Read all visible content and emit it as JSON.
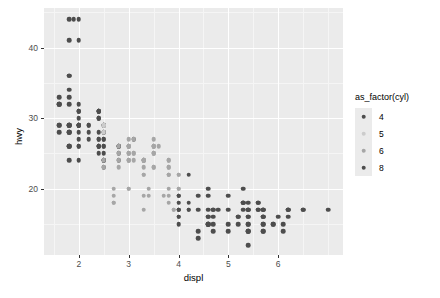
{
  "chart_data": {
    "type": "scatter",
    "title": "",
    "xlabel": "displ",
    "ylabel": "hwy",
    "xlim": [
      1.3,
      7.3
    ],
    "ylim": [
      10.6,
      45.6
    ],
    "xticks": [
      2,
      3,
      4,
      5,
      6
    ],
    "yticks": [
      20,
      30,
      40
    ],
    "xtick_labels": [
      "2",
      "3",
      "4",
      "5",
      "6"
    ],
    "ytick_labels": [
      "20",
      "30",
      "40"
    ],
    "xminor": [
      1.5,
      2.5,
      3.5,
      4.5,
      5.5,
      6.5,
      7
    ],
    "yminor": [
      15,
      25,
      35,
      45
    ],
    "grid": true,
    "panel_background": "#ebebeb",
    "gridline_color": "#ffffff",
    "legend": {
      "title": "as_factor(cyl)",
      "position": "right",
      "entries": [
        {
          "label": "4",
          "color": "#4d4d4d"
        },
        {
          "label": "5",
          "color": "#cccccc"
        },
        {
          "label": "6",
          "color": "#a6a6a6"
        },
        {
          "label": "8",
          "color": "#4d4d4d"
        }
      ]
    },
    "series": [
      {
        "name": "4",
        "color": "#4d4d4d",
        "points": [
          [
            1.8,
            29
          ],
          [
            1.8,
            29
          ],
          [
            2.0,
            31
          ],
          [
            2.0,
            30
          ],
          [
            1.8,
            26
          ],
          [
            1.8,
            26
          ],
          [
            2.0,
            27
          ],
          [
            2.0,
            26
          ],
          [
            2.8,
            25
          ],
          [
            2.8,
            24
          ],
          [
            1.8,
            33
          ],
          [
            1.8,
            32
          ],
          [
            2.0,
            32
          ],
          [
            2.0,
            31
          ],
          [
            2.8,
            26
          ],
          [
            2.8,
            26
          ],
          [
            3.1,
            27
          ],
          [
            1.8,
            28
          ],
          [
            1.8,
            24
          ],
          [
            2.0,
            24
          ],
          [
            2.0,
            31
          ],
          [
            2.8,
            26
          ],
          [
            2.4,
            26
          ],
          [
            2.4,
            27
          ],
          [
            2.4,
            26
          ],
          [
            2.4,
            25
          ],
          [
            2.5,
            28
          ],
          [
            2.5,
            24
          ],
          [
            2.5,
            27
          ],
          [
            2.5,
            25
          ],
          [
            2.2,
            29
          ],
          [
            2.2,
            29
          ],
          [
            2.4,
            31
          ],
          [
            2.4,
            31
          ],
          [
            2.4,
            26
          ],
          [
            2.4,
            28
          ],
          [
            2.5,
            27
          ],
          [
            2.5,
            24
          ],
          [
            1.6,
            33
          ],
          [
            1.6,
            32
          ],
          [
            1.6,
            32
          ],
          [
            1.6,
            29
          ],
          [
            1.6,
            32
          ],
          [
            1.8,
            34
          ],
          [
            1.8,
            36
          ],
          [
            1.8,
            36
          ],
          [
            2.0,
            29
          ],
          [
            2.4,
            26
          ],
          [
            2.4,
            27
          ],
          [
            2.4,
            30
          ],
          [
            2.4,
            31
          ],
          [
            2.5,
            26
          ],
          [
            2.5,
            26
          ],
          [
            3.3,
            24
          ],
          [
            2.0,
            44
          ],
          [
            2.0,
            41
          ],
          [
            2.0,
            29
          ],
          [
            2.0,
            26
          ],
          [
            2.0,
            28
          ],
          [
            2.0,
            29
          ],
          [
            2.5,
            29
          ],
          [
            2.5,
            29
          ],
          [
            1.9,
            44
          ],
          [
            2.0,
            29
          ],
          [
            2.0,
            29
          ],
          [
            2.0,
            29
          ],
          [
            2.0,
            29
          ],
          [
            2.5,
            23
          ],
          [
            2.5,
            24
          ],
          [
            1.8,
            44
          ],
          [
            1.8,
            41
          ],
          [
            1.8,
            29
          ],
          [
            1.8,
            26
          ],
          [
            1.8,
            28
          ],
          [
            1.8,
            29
          ],
          [
            2.2,
            27
          ],
          [
            2.2,
            28
          ],
          [
            2.4,
            30
          ],
          [
            2.4,
            31
          ],
          [
            2.4,
            31
          ],
          [
            2.4,
            30
          ],
          [
            2.5,
            29
          ],
          [
            2.5,
            29
          ],
          [
            2.5,
            28
          ],
          [
            1.6,
            28
          ],
          [
            1.6,
            29
          ],
          [
            1.8,
            28
          ]
        ]
      },
      {
        "name": "5",
        "color": "#cccccc",
        "points": [
          [
            2.5,
            29
          ],
          [
            2.5,
            29
          ],
          [
            2.5,
            28
          ],
          [
            2.5,
            29
          ]
        ]
      },
      {
        "name": "6",
        "color": "#a6a6a6",
        "points": [
          [
            2.8,
            26
          ],
          [
            2.8,
            25
          ],
          [
            3.1,
            27
          ],
          [
            3.1,
            25
          ],
          [
            2.8,
            24
          ],
          [
            3.1,
            25
          ],
          [
            2.8,
            23
          ],
          [
            3.1,
            24
          ],
          [
            3.8,
            24
          ],
          [
            3.8,
            24
          ],
          [
            4.0,
            22
          ],
          [
            3.7,
            19
          ],
          [
            3.9,
            17
          ],
          [
            3.9,
            17
          ],
          [
            3.0,
            26
          ],
          [
            3.0,
            25
          ],
          [
            3.5,
            25
          ],
          [
            3.5,
            26
          ],
          [
            3.0,
            27
          ],
          [
            3.3,
            24
          ],
          [
            3.3,
            24
          ],
          [
            3.3,
            22
          ],
          [
            3.3,
            24
          ],
          [
            3.3,
            24
          ],
          [
            3.8,
            23
          ],
          [
            3.8,
            22
          ],
          [
            3.8,
            23
          ],
          [
            4.0,
            22
          ],
          [
            3.0,
            26
          ],
          [
            3.0,
            26
          ],
          [
            3.5,
            26
          ],
          [
            3.5,
            25
          ],
          [
            3.0,
            25
          ],
          [
            3.0,
            24
          ],
          [
            3.5,
            27
          ],
          [
            3.5,
            25
          ],
          [
            3.0,
            26
          ],
          [
            3.0,
            24
          ],
          [
            2.7,
            20
          ],
          [
            2.7,
            18
          ],
          [
            3.4,
            20
          ],
          [
            3.4,
            19
          ],
          [
            4.0,
            20
          ],
          [
            4.0,
            17
          ],
          [
            3.5,
            23
          ],
          [
            3.5,
            23
          ],
          [
            3.8,
            22
          ],
          [
            3.8,
            22
          ],
          [
            4.0,
            19
          ],
          [
            4.0,
            18
          ],
          [
            2.7,
            19
          ],
          [
            2.7,
            18
          ],
          [
            3.0,
            20
          ],
          [
            3.0,
            20
          ],
          [
            3.3,
            17
          ],
          [
            3.3,
            19
          ],
          [
            3.8,
            20
          ],
          [
            3.8,
            18
          ],
          [
            3.5,
            26
          ],
          [
            3.5,
            26
          ],
          [
            3.6,
            26
          ],
          [
            2.5,
            23
          ],
          [
            2.5,
            24
          ],
          [
            3.3,
            22
          ],
          [
            3.3,
            23
          ],
          [
            4.0,
            20
          ],
          [
            4.0,
            19
          ],
          [
            3.0,
            25
          ],
          [
            3.0,
            26
          ],
          [
            3.0,
            24
          ],
          [
            3.8,
            19
          ]
        ]
      },
      {
        "name": "8",
        "color": "#4d4d4d",
        "points": [
          [
            5.7,
            17
          ],
          [
            5.7,
            17
          ],
          [
            6.2,
            17
          ],
          [
            6.2,
            16
          ],
          [
            7.0,
            17
          ],
          [
            5.3,
            20
          ],
          [
            5.3,
            18
          ],
          [
            5.3,
            17
          ],
          [
            5.7,
            16
          ],
          [
            6.0,
            16
          ],
          [
            5.7,
            15
          ],
          [
            6.2,
            17
          ],
          [
            6.2,
            17
          ],
          [
            5.4,
            17
          ],
          [
            5.4,
            17
          ],
          [
            4.0,
            17
          ],
          [
            4.0,
            16
          ],
          [
            4.6,
            15
          ],
          [
            5.0,
            15
          ],
          [
            4.2,
            17
          ],
          [
            4.4,
            14
          ],
          [
            4.6,
            15
          ],
          [
            5.4,
            14
          ],
          [
            5.4,
            14
          ],
          [
            4.0,
            16
          ],
          [
            4.0,
            15
          ],
          [
            4.6,
            15
          ],
          [
            5.0,
            14
          ],
          [
            4.2,
            17
          ],
          [
            4.4,
            13
          ],
          [
            4.6,
            15
          ],
          [
            5.4,
            12
          ],
          [
            5.4,
            14
          ],
          [
            4.7,
            14
          ],
          [
            5.7,
            14
          ],
          [
            5.7,
            14
          ],
          [
            6.1,
            15
          ],
          [
            4.0,
            18
          ],
          [
            4.2,
            18
          ],
          [
            4.4,
            17
          ],
          [
            4.6,
            17
          ],
          [
            5.4,
            16
          ],
          [
            5.4,
            16
          ],
          [
            4.7,
            15
          ],
          [
            5.7,
            15
          ],
          [
            6.1,
            14
          ],
          [
            4.0,
            19
          ],
          [
            4.6,
            19
          ],
          [
            5.0,
            17
          ],
          [
            4.8,
            17
          ],
          [
            5.2,
            16
          ],
          [
            4.7,
            16
          ],
          [
            5.2,
            15
          ],
          [
            5.7,
            16
          ],
          [
            5.9,
            15
          ],
          [
            4.7,
            17
          ],
          [
            4.7,
            17
          ],
          [
            5.2,
            16
          ],
          [
            5.7,
            16
          ],
          [
            5.9,
            15
          ],
          [
            4.6,
            16
          ],
          [
            5.4,
            15
          ],
          [
            5.4,
            15
          ],
          [
            4.0,
            17
          ],
          [
            4.0,
            17
          ],
          [
            6.5,
            17
          ],
          [
            5.6,
            18
          ],
          [
            5.6,
            18
          ],
          [
            5.6,
            17
          ],
          [
            5.6,
            17
          ],
          [
            4.6,
            16
          ],
          [
            5.4,
            17
          ],
          [
            4.0,
            19
          ],
          [
            5.0,
            19
          ],
          [
            5.3,
            18
          ],
          [
            5.3,
            18
          ],
          [
            5.7,
            17
          ],
          [
            6.5,
            17
          ],
          [
            4.6,
            20
          ],
          [
            5.4,
            18
          ],
          [
            4.2,
            22
          ],
          [
            4.4,
            19
          ]
        ]
      }
    ]
  }
}
